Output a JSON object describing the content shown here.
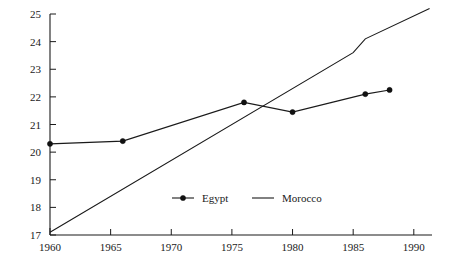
{
  "chart_data": {
    "type": "line",
    "title": "",
    "subtitle": "",
    "xlabel": "",
    "ylabel": "",
    "xlim": [
      1960,
      1991.5
    ],
    "ylim": [
      17,
      25
    ],
    "grid": false,
    "legend_position": "bottom-center",
    "x_ticks": [
      1960,
      1965,
      1970,
      1975,
      1980,
      1985,
      1990
    ],
    "x_tick_labels": [
      "1960",
      "1965",
      "1970",
      "1975",
      "1980",
      "1985",
      "1990"
    ],
    "y_ticks": [
      17,
      18,
      19,
      20,
      21,
      22,
      23,
      24,
      25
    ],
    "y_tick_labels": [
      "17",
      "18",
      "19",
      "20",
      "21",
      "22",
      "23",
      "24",
      "25"
    ],
    "series": [
      {
        "name": "Egypt",
        "marker": "filled-circle",
        "x": [
          1960,
          1966,
          1976,
          1980,
          1986,
          1988
        ],
        "values": [
          20.3,
          20.4,
          21.8,
          21.45,
          22.1,
          22.25
        ]
      },
      {
        "name": "Morocco",
        "marker": "none",
        "x": [
          1960,
          1985,
          1986,
          1991.3
        ],
        "values": [
          17.1,
          23.6,
          24.1,
          25.2
        ]
      }
    ]
  },
  "legend": {
    "entries": [
      {
        "label": "Egypt",
        "marker": "line-with-dot"
      },
      {
        "label": "Morocco",
        "marker": "line"
      }
    ]
  },
  "axes": {
    "y_axis_name": "y-axis",
    "x_axis_name": "x-axis"
  }
}
